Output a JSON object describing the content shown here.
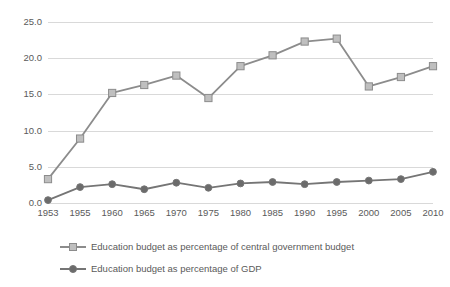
{
  "chart_data": {
    "type": "line",
    "title": "",
    "subtitle": "",
    "xlabel": "",
    "ylabel": "",
    "categories": [
      "1953",
      "1955",
      "1960",
      "1965",
      "1970",
      "1975",
      "1980",
      "1985",
      "1990",
      "1995",
      "2000",
      "2005",
      "2010"
    ],
    "ylim": [
      0.0,
      25.0
    ],
    "yticks": [
      "0.0",
      "5.0",
      "10.0",
      "15.0",
      "20.0",
      "25.0"
    ],
    "ytick_values": [
      0.0,
      5.0,
      10.0,
      15.0,
      20.0,
      25.0
    ],
    "grid": true,
    "legend_position": "bottom-left",
    "series": [
      {
        "name": "Education budget as percentage of central government budget",
        "marker": "square",
        "color": "#8c8c8c",
        "marker_fill": "#bfbfbf",
        "values": [
          3.3,
          8.9,
          15.2,
          16.3,
          17.6,
          14.5,
          18.9,
          20.4,
          22.3,
          22.7,
          16.1,
          17.4,
          18.9
        ]
      },
      {
        "name": "Education budget as percentage of GDP",
        "marker": "circle",
        "color": "#757575",
        "marker_fill": "#6b6b6b",
        "values": [
          0.4,
          2.2,
          2.6,
          1.9,
          2.8,
          2.1,
          2.7,
          2.9,
          2.6,
          2.9,
          3.1,
          3.3,
          4.3
        ]
      }
    ],
    "colors": {
      "gridline": "#d9d9d9",
      "text": "#5a5a5a",
      "background": "#ffffff"
    }
  }
}
